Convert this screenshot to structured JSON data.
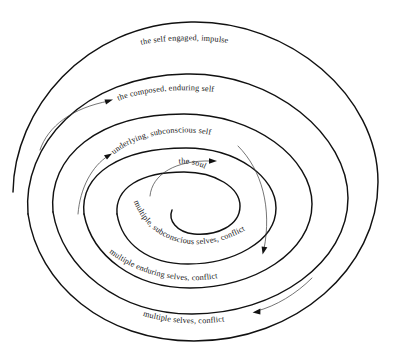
{
  "diagram": {
    "type": "spiral",
    "background_color": "#ffffff",
    "stroke_color": "#111111",
    "pointer_color": "#3a3a3a",
    "center": {
      "x": 190,
      "y": 190
    },
    "turns": 3,
    "labels": [
      {
        "id": "ring-outer",
        "text": "the self engaged, ",
        "emphasis": "impulse",
        "ring": 1,
        "position": "top-outermost"
      },
      {
        "id": "ring-second",
        "text": "the composed, enduring self",
        "emphasis": "",
        "ring": 2,
        "position": "top-second"
      },
      {
        "id": "ring-third",
        "text": "underlying, subconscious self",
        "emphasis": "",
        "ring": 3,
        "position": "top-third"
      },
      {
        "id": "core",
        "text": "the soul",
        "emphasis": "",
        "ring": 4,
        "position": "center"
      },
      {
        "id": "ring-inner-lower",
        "text": "multiple, subconscious selves, conflict",
        "emphasis": "",
        "ring": 3,
        "position": "bottom-inner"
      },
      {
        "id": "ring-mid-lower",
        "text": "multiple enduring selves, conflict",
        "emphasis": "",
        "ring": 2,
        "position": "bottom-middle"
      },
      {
        "id": "ring-outer-lower",
        "text": "multiple selves, conflict",
        "emphasis": "",
        "ring": 1,
        "position": "bottom-outermost"
      }
    ],
    "arrows": [
      {
        "id": "arrow-to-composed-self",
        "direction": "up-right",
        "tip_x": 112,
        "tip_y": 100
      },
      {
        "id": "arrow-to-underlying-self",
        "direction": "up-right",
        "tip_x": 111,
        "tip_y": 154
      },
      {
        "id": "arrow-to-soul",
        "direction": "right",
        "tip_x": 216,
        "tip_y": 161
      },
      {
        "id": "arrow-to-subconscious-selves",
        "direction": "down-left",
        "tip_x": 262,
        "tip_y": 252
      },
      {
        "id": "arrow-to-multiple-selves",
        "direction": "down-left",
        "tip_x": 254,
        "tip_y": 312
      }
    ]
  }
}
